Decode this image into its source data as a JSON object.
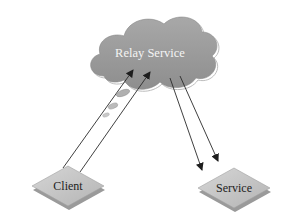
{
  "diagram": {
    "type": "relay-architecture",
    "nodes": {
      "relay": {
        "label": "Relay Service",
        "shape": "cloud",
        "fill": "#9c9c9c"
      },
      "client": {
        "label": "Client",
        "shape": "diamond",
        "fill": "#c8c8c8"
      },
      "service": {
        "label": "Service",
        "shape": "diamond",
        "fill": "#c8c8c8"
      }
    },
    "edges": [
      {
        "from": "client",
        "to": "relay",
        "count": 2,
        "note": "message packets along arrow"
      },
      {
        "from": "relay",
        "to": "service",
        "count": 2
      }
    ],
    "colors": {
      "arrow": "#2a2a2a",
      "cloud": "#9c9c9c",
      "diamond": "#c8c8c8",
      "packet": "#aaaaaa"
    }
  }
}
